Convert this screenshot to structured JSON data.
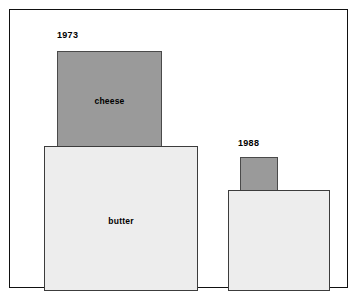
{
  "chart_data": {
    "type": "bar",
    "title": "",
    "subtitle": "",
    "xlabel": "",
    "ylabel": "",
    "grid": false,
    "legend": "none",
    "note": "Two proportional area (nested square) diagrams comparing butter and cheese quantities in 1973 versus 1988. Each group draws a large light-gray square for butter with a smaller dark-gray square for cheese rising above it; all squares rest on a shared baseline.",
    "categories": [
      "1973",
      "1988"
    ],
    "series": [
      {
        "name": "butter",
        "values": [
          154,
          102
        ],
        "unit": "square side (px)",
        "color": "#ededed"
      },
      {
        "name": "cheese",
        "values": [
          105,
          38
        ],
        "unit": "square side (px)",
        "color": "#9a9a9a"
      }
    ],
    "groups": [
      {
        "year": "1973",
        "boxes": [
          {
            "label": "cheese",
            "width": 105,
            "height": 96,
            "fill": "#9a9a9a"
          },
          {
            "label": "butter",
            "width": 154,
            "height": 145,
            "fill": "#ededed"
          }
        ]
      },
      {
        "year": "1988",
        "boxes": [
          {
            "label": "",
            "width": 38,
            "height": 34,
            "fill": "#9a9a9a"
          },
          {
            "label": "",
            "width": 102,
            "height": 101,
            "fill": "#ededed"
          }
        ]
      }
    ]
  },
  "figure": {
    "frame_color": "#111111",
    "background": "#ffffff"
  },
  "groups": {
    "y1973": {
      "year_label": "1973",
      "cheese_label": "cheese",
      "butter_label": "butter"
    },
    "y1988": {
      "year_label": "1988",
      "cheese_label": "",
      "butter_label": ""
    }
  }
}
